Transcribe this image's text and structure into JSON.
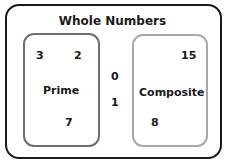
{
  "title": "Whole Numbers",
  "sets": {
    "prime": {
      "label": "Prime",
      "elements": [
        "3",
        "2",
        "7"
      ],
      "border_color": "#6e6e6e"
    },
    "composite": {
      "label": "Composite",
      "elements": [
        "15",
        "8"
      ],
      "border_color": "#a8a8a8"
    }
  },
  "outside": [
    "0",
    "1"
  ]
}
